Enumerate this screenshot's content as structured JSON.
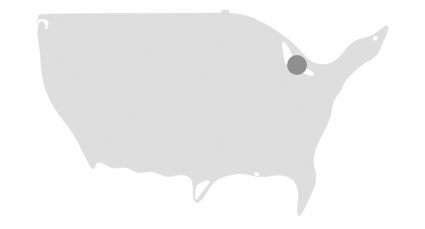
{
  "figure": {
    "kind": "map",
    "title": "",
    "width": 425,
    "height": 229,
    "background_color": "#ffffff"
  },
  "map": {
    "name": "contiguous-united-states",
    "region_label": "Contiguous United States",
    "land_fill_color": "#dedede",
    "land_stroke_color": "#dedede",
    "state_borders_visible": false,
    "labels_visible": false,
    "legend_visible": false,
    "bounds_px": {
      "left": 36,
      "top": 14,
      "right": 398,
      "bottom": 217
    }
  },
  "markers": [
    {
      "name": "location-marker",
      "label": "",
      "shape": "circle",
      "color": "#8f8f8f",
      "cx": 297,
      "cy": 65,
      "r": 10,
      "approximate_region": "Upstate New York"
    }
  ],
  "chart_data": {
    "type": "map",
    "title": "",
    "subtitle": "",
    "xlabel": "",
    "ylabel": "",
    "grid": false,
    "legend_position": "none",
    "basemap": "contiguous-united-states-silhouette",
    "basemap_fill": "#dedede",
    "background": "#ffffff",
    "point_color": "#8f8f8f",
    "point_radius_px": 10,
    "points": [
      {
        "label": "",
        "x_px": 297,
        "y_px": 65,
        "value": 1
      }
    ],
    "annotations": []
  }
}
